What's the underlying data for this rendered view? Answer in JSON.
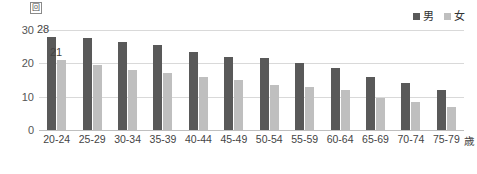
{
  "chart_data": {
    "type": "bar",
    "title": "",
    "xlabel": "歳",
    "ylabel": "回",
    "ylim": [
      0,
      30
    ],
    "yticks": [
      0,
      10,
      20,
      30
    ],
    "grid": true,
    "legend_position": "top-right",
    "categories": [
      "20-24",
      "25-29",
      "30-34",
      "35-39",
      "40-44",
      "45-49",
      "50-54",
      "55-59",
      "60-64",
      "65-69",
      "70-74",
      "75-79"
    ],
    "series": [
      {
        "name": "男",
        "color": "#595959",
        "values": [
          28,
          27.5,
          26.5,
          25.5,
          23.5,
          22,
          21.5,
          20,
          18.5,
          16,
          14,
          12
        ]
      },
      {
        "name": "女",
        "color": "#bfbfbf",
        "values": [
          21,
          19.5,
          18,
          17,
          16,
          15,
          13.5,
          13,
          12,
          9.7,
          8.5,
          7
        ]
      }
    ],
    "data_labels": [
      {
        "group": 0,
        "series": 0,
        "text": "28"
      },
      {
        "group": 0,
        "series": 1,
        "text": "21"
      }
    ]
  },
  "axes": {
    "y_unit_label": "回",
    "x_unit_label": "歳",
    "y_tick_labels": [
      "30",
      "20",
      "10",
      "0"
    ]
  },
  "legend": {
    "items": [
      {
        "label": "男",
        "color": "#595959"
      },
      {
        "label": "女",
        "color": "#bfbfbf"
      }
    ]
  },
  "colors": {
    "male": "#595959",
    "female": "#bfbfbf",
    "grid": "#d9d9d9",
    "axis": "#bfbfbf",
    "background": "#ffffff"
  }
}
